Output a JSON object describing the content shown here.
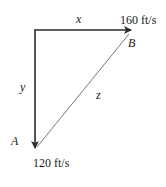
{
  "diagram": {
    "type": "vector-triangle",
    "colors": {
      "stroke": "#2a2a2a",
      "hypotenuse": "#555555",
      "text": "#1a1a1a"
    },
    "vectors": [
      {
        "id": "x",
        "label": "x",
        "direction": "right",
        "magnitude_label": "160 ft/s",
        "endpoint_label": "B"
      },
      {
        "id": "y",
        "label": "y",
        "direction": "down",
        "magnitude_label": "120 ft/s",
        "endpoint_label": "A"
      },
      {
        "id": "z",
        "label": "z",
        "from": "A",
        "to": "B",
        "style": "thin-line"
      }
    ],
    "labels": {
      "x": "x",
      "y": "y",
      "z": "z",
      "point_a": "A",
      "point_b": "B",
      "speed_x": "160 ft/s",
      "speed_y": "120 ft/s"
    }
  }
}
